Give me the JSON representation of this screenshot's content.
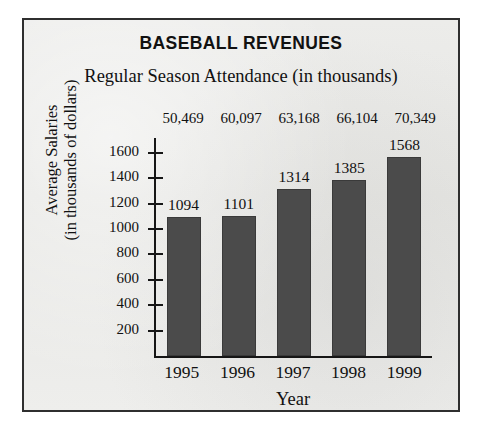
{
  "figure": {
    "title": "BASEBALL REVENUES",
    "subtitle": "Regular Season Attendance (in thousands)",
    "background_color": "#e9e9e7",
    "border_color": "#2f2f2f",
    "bar_color": "#4b4b4b",
    "axis_color": "#161616",
    "text_color": "#111111"
  },
  "axis_titles": {
    "y_line1": "Average Salaries",
    "y_line2": "(in thousands of dollars)",
    "x": "Year"
  },
  "chart_data": {
    "type": "bar",
    "title": "BASEBALL REVENUES",
    "subtitle": "Regular Season Attendance (in thousands)",
    "xlabel": "Year",
    "ylabel": "Average Salaries (in thousands of dollars)",
    "categories": [
      "1995",
      "1996",
      "1997",
      "1998",
      "1999"
    ],
    "values": [
      1094,
      1101,
      1314,
      1385,
      1568
    ],
    "data_labels": [
      "1094",
      "1101",
      "1314",
      "1385",
      "1568"
    ],
    "secondary_labels_title": "Regular Season Attendance (in thousands)",
    "secondary_labels": [
      "50,469",
      "60,097",
      "63,168",
      "66,104",
      "70,349"
    ],
    "secondary_values": [
      50469,
      60097,
      63168,
      66104,
      70349
    ],
    "ylim": [
      0,
      1700
    ],
    "yticks": [
      200,
      400,
      600,
      800,
      1000,
      1200,
      1400,
      1600
    ],
    "ytick_labels": [
      "200",
      "400",
      "600",
      "800",
      "1000",
      "1200",
      "1400",
      "1600"
    ],
    "grid": false,
    "legend": false
  }
}
